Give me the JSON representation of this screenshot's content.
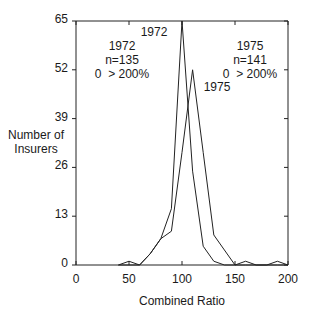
{
  "chart_data": {
    "type": "line",
    "title": "",
    "xlabel": "Combined Ratio",
    "ylabel": "Number of Insurers",
    "xlim": [
      0,
      200
    ],
    "ylim": [
      0,
      65
    ],
    "x_ticks": [
      "0",
      "50",
      "100",
      "150",
      "200"
    ],
    "y_ticks": [
      "0",
      "13",
      "26",
      "39",
      "52",
      "65"
    ],
    "grid": false,
    "x": [
      40,
      50,
      60,
      70,
      80,
      90,
      100,
      110,
      120,
      130,
      140,
      150,
      160,
      170,
      180,
      190,
      200
    ],
    "series": [
      {
        "name": "1972",
        "values": [
          0,
          1,
          0,
          3,
          7,
          15,
          65,
          25,
          5,
          1,
          0,
          0,
          0,
          0,
          0,
          0,
          0
        ]
      },
      {
        "name": "1975",
        "values": [
          0,
          0,
          0,
          3,
          7,
          9,
          30,
          52,
          30,
          8,
          4,
          0,
          1,
          0,
          0,
          1,
          0
        ]
      }
    ],
    "annotations": [
      {
        "text": "1972",
        "near": "peak of 1972 series"
      },
      {
        "text": "1975",
        "near": "peak of 1975 series"
      }
    ],
    "legend_boxes": [
      {
        "year": "1972",
        "n": "n=135",
        "range": "0  > 200%"
      },
      {
        "year": "1975",
        "n": "n=141",
        "range": "0  > 200%"
      }
    ]
  },
  "labels": {
    "ylabel_line1": "Number of",
    "ylabel_line2": "Insurers",
    "xlabel": "Combined Ratio",
    "peak1972": "1972",
    "peak1975": "1975",
    "box1972": {
      "year": "1972",
      "n": "n=135",
      "range": "0  > 200%"
    },
    "box1975": {
      "year": "1975",
      "n": "n=141",
      "range": "0  > 200%"
    }
  }
}
